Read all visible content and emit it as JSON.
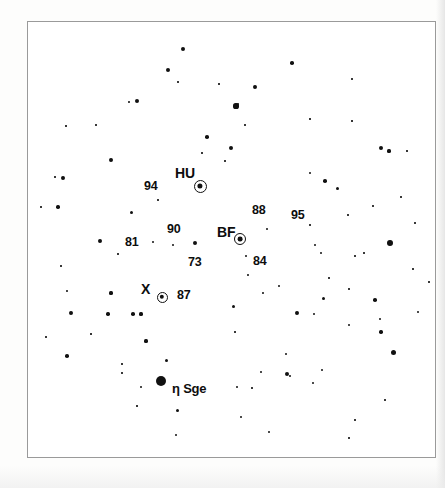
{
  "chart_data": {
    "type": "scatter",
    "title": "",
    "subtitle": "",
    "xlabel": "",
    "ylabel": "",
    "grid": false,
    "legend": null,
    "frame": {
      "x": 27,
      "y": 21,
      "width": 409,
      "height": 437
    },
    "variable_stars": [
      {
        "name": "HU",
        "x": 199,
        "y": 185,
        "ring_radius": 6.5,
        "core_radius": 2.6,
        "label_x": 174,
        "label_y": 165
      },
      {
        "name": "BF",
        "x": 239,
        "y": 238,
        "ring_radius": 6.0,
        "core_radius": 2.4,
        "label_x": 216,
        "label_y": 224
      },
      {
        "name": "X",
        "x": 161,
        "y": 296,
        "ring_radius": 5.5,
        "core_radius": 2.2,
        "label_x": 140,
        "label_y": 281
      }
    ],
    "comparison_labels": [
      {
        "text": "94",
        "x": 143,
        "y": 179
      },
      {
        "text": "88",
        "x": 251,
        "y": 203
      },
      {
        "text": "95",
        "x": 290,
        "y": 208
      },
      {
        "text": "90",
        "x": 166,
        "y": 222
      },
      {
        "text": "81",
        "x": 124,
        "y": 235
      },
      {
        "text": "73",
        "x": 187,
        "y": 255
      },
      {
        "text": "84",
        "x": 252,
        "y": 254
      },
      {
        "text": "87",
        "x": 176,
        "y": 288
      }
    ],
    "named_star": {
      "text": "η Sge",
      "x": 171,
      "y": 381,
      "marker_x": 160,
      "marker_y": 380,
      "marker_radius": 5.2
    },
    "stars": [
      {
        "x": 182,
        "y": 48,
        "r": 2.2
      },
      {
        "x": 167,
        "y": 69,
        "r": 2.0
      },
      {
        "x": 177,
        "y": 81,
        "r": 0.8
      },
      {
        "x": 218,
        "y": 83,
        "r": 0.7
      },
      {
        "x": 254,
        "y": 86,
        "r": 1.9
      },
      {
        "x": 136,
        "y": 100,
        "r": 2.1
      },
      {
        "x": 128,
        "y": 101,
        "r": 0.9
      },
      {
        "x": 291,
        "y": 62,
        "r": 1.8
      },
      {
        "x": 235,
        "y": 105,
        "r": 2.6
      },
      {
        "x": 237,
        "y": 103,
        "r": 1.2
      },
      {
        "x": 351,
        "y": 78,
        "r": 0.8
      },
      {
        "x": 206,
        "y": 136,
        "r": 1.8
      },
      {
        "x": 230,
        "y": 147,
        "r": 2.0
      },
      {
        "x": 201,
        "y": 152,
        "r": 0.8
      },
      {
        "x": 224,
        "y": 160,
        "r": 0.8
      },
      {
        "x": 380,
        "y": 147,
        "r": 2.3
      },
      {
        "x": 388,
        "y": 150,
        "r": 1.6
      },
      {
        "x": 406,
        "y": 150,
        "r": 0.7
      },
      {
        "x": 110,
        "y": 159,
        "r": 1.9
      },
      {
        "x": 54,
        "y": 176,
        "r": 0.8
      },
      {
        "x": 62,
        "y": 177,
        "r": 1.9
      },
      {
        "x": 309,
        "y": 172,
        "r": 1.4
      },
      {
        "x": 324,
        "y": 180,
        "r": 1.8
      },
      {
        "x": 336,
        "y": 187,
        "r": 1.5
      },
      {
        "x": 157,
        "y": 199,
        "r": 0.8
      },
      {
        "x": 130,
        "y": 211,
        "r": 1.5
      },
      {
        "x": 40,
        "y": 206,
        "r": 0.8
      },
      {
        "x": 57,
        "y": 206,
        "r": 1.7
      },
      {
        "x": 266,
        "y": 228,
        "r": 1.0
      },
      {
        "x": 309,
        "y": 224,
        "r": 0.8
      },
      {
        "x": 347,
        "y": 214,
        "r": 0.8
      },
      {
        "x": 99,
        "y": 240,
        "r": 1.9
      },
      {
        "x": 152,
        "y": 241,
        "r": 1.2
      },
      {
        "x": 172,
        "y": 244,
        "r": 1.0
      },
      {
        "x": 194,
        "y": 242,
        "r": 2.4
      },
      {
        "x": 245,
        "y": 255,
        "r": 1.1
      },
      {
        "x": 389,
        "y": 242,
        "r": 2.9
      },
      {
        "x": 314,
        "y": 244,
        "r": 1.0
      },
      {
        "x": 320,
        "y": 252,
        "r": 1.3
      },
      {
        "x": 354,
        "y": 255,
        "r": 0.8
      },
      {
        "x": 363,
        "y": 252,
        "r": 0.8
      },
      {
        "x": 117,
        "y": 253,
        "r": 0.8
      },
      {
        "x": 60,
        "y": 265,
        "r": 0.8
      },
      {
        "x": 247,
        "y": 274,
        "r": 0.9
      },
      {
        "x": 278,
        "y": 285,
        "r": 1.2
      },
      {
        "x": 328,
        "y": 277,
        "r": 0.8
      },
      {
        "x": 412,
        "y": 268,
        "r": 0.8
      },
      {
        "x": 428,
        "y": 281,
        "r": 0.8
      },
      {
        "x": 110,
        "y": 292,
        "r": 1.6
      },
      {
        "x": 262,
        "y": 292,
        "r": 0.9
      },
      {
        "x": 322,
        "y": 297,
        "r": 1.5
      },
      {
        "x": 348,
        "y": 288,
        "r": 0.8
      },
      {
        "x": 374,
        "y": 299,
        "r": 1.8
      },
      {
        "x": 66,
        "y": 290,
        "r": 0.9
      },
      {
        "x": 70,
        "y": 312,
        "r": 1.9
      },
      {
        "x": 107,
        "y": 313,
        "r": 1.7
      },
      {
        "x": 132,
        "y": 313,
        "r": 1.8
      },
      {
        "x": 140,
        "y": 313,
        "r": 1.6
      },
      {
        "x": 296,
        "y": 312,
        "r": 1.9
      },
      {
        "x": 232,
        "y": 305,
        "r": 1.5
      },
      {
        "x": 313,
        "y": 313,
        "r": 1.0
      },
      {
        "x": 417,
        "y": 311,
        "r": 1.4
      },
      {
        "x": 234,
        "y": 331,
        "r": 0.8
      },
      {
        "x": 379,
        "y": 318,
        "r": 1.3
      },
      {
        "x": 380,
        "y": 331,
        "r": 1.7
      },
      {
        "x": 348,
        "y": 324,
        "r": 1.1
      },
      {
        "x": 145,
        "y": 340,
        "r": 1.6
      },
      {
        "x": 392,
        "y": 351,
        "r": 2.5
      },
      {
        "x": 66,
        "y": 355,
        "r": 1.8
      },
      {
        "x": 165,
        "y": 359,
        "r": 1.5
      },
      {
        "x": 285,
        "y": 353,
        "r": 1.1
      },
      {
        "x": 260,
        "y": 371,
        "r": 1.3
      },
      {
        "x": 321,
        "y": 369,
        "r": 1.0
      },
      {
        "x": 121,
        "y": 363,
        "r": 0.8
      },
      {
        "x": 121,
        "y": 372,
        "r": 0.8
      },
      {
        "x": 236,
        "y": 386,
        "r": 1.0
      },
      {
        "x": 251,
        "y": 387,
        "r": 0.8
      },
      {
        "x": 140,
        "y": 386,
        "r": 1.1
      },
      {
        "x": 286,
        "y": 373,
        "r": 2.3
      },
      {
        "x": 289,
        "y": 375,
        "r": 1.1
      },
      {
        "x": 312,
        "y": 382,
        "r": 1.0
      },
      {
        "x": 136,
        "y": 405,
        "r": 0.7
      },
      {
        "x": 176,
        "y": 409,
        "r": 1.5
      },
      {
        "x": 240,
        "y": 416,
        "r": 1.3
      },
      {
        "x": 268,
        "y": 431,
        "r": 1.2
      },
      {
        "x": 175,
        "y": 434,
        "r": 1.4
      },
      {
        "x": 354,
        "y": 419,
        "r": 0.8
      },
      {
        "x": 384,
        "y": 399,
        "r": 0.8
      },
      {
        "x": 348,
        "y": 437,
        "r": 0.8
      },
      {
        "x": 45,
        "y": 336,
        "r": 0.8
      },
      {
        "x": 90,
        "y": 333,
        "r": 0.7
      },
      {
        "x": 414,
        "y": 222,
        "r": 0.8
      },
      {
        "x": 400,
        "y": 196,
        "r": 0.8
      },
      {
        "x": 372,
        "y": 205,
        "r": 0.8
      },
      {
        "x": 95,
        "y": 124,
        "r": 0.8
      },
      {
        "x": 244,
        "y": 124,
        "r": 0.8
      },
      {
        "x": 309,
        "y": 118,
        "r": 0.7
      },
      {
        "x": 351,
        "y": 120,
        "r": 0.7
      },
      {
        "x": 65,
        "y": 125,
        "r": 0.7
      }
    ]
  }
}
